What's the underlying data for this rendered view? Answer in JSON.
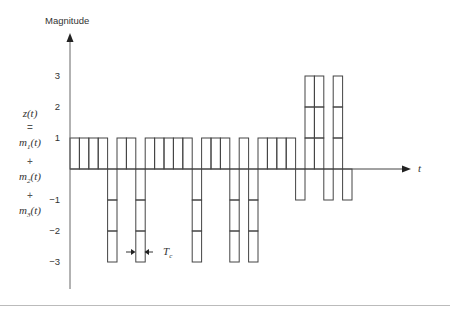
{
  "figure": {
    "y_axis_label": "Magnitude",
    "x_axis_label": "t",
    "chip_width_label": "T",
    "chip_width_subscript": "c",
    "signal_label": {
      "line1": "z(t)",
      "line2": "=",
      "line3": "m1(t)",
      "line4": "+",
      "line5": "m2(t)",
      "line6": "+",
      "line7": "m3(t)"
    },
    "y_ticks": [
      "3",
      "2",
      "1",
      "−1",
      "−2",
      "−3"
    ]
  },
  "chart_data": {
    "type": "bar",
    "title": "",
    "xlabel": "t",
    "ylabel": "Magnitude",
    "ylim": [
      -3.5,
      4
    ],
    "grid": false,
    "chips": [
      1,
      1,
      1,
      1,
      -3,
      1,
      1,
      -3,
      1,
      1,
      1,
      1,
      1,
      -3,
      1,
      1,
      1,
      -3,
      1,
      -3,
      1,
      1,
      1,
      1,
      -1,
      3,
      3,
      -1,
      3,
      -1
    ],
    "annotation": "Tc (chip width)"
  },
  "colors": {
    "line": "#444444",
    "axis": "#555555",
    "text": "#333333"
  }
}
